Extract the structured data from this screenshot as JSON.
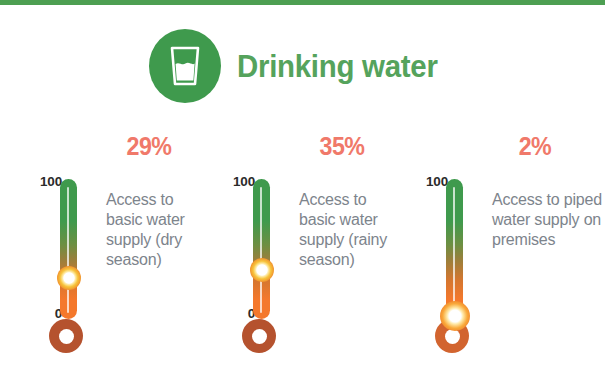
{
  "top_rule": {
    "color": "#4d9f52"
  },
  "header": {
    "icon_name": "drinking-glass-icon",
    "icon_bg_color": "#3f9a4d",
    "title": "Drinking water",
    "title_color": "#55a35c"
  },
  "theme": {
    "percent_color": "#f0796a",
    "caption_color": "#7d848c",
    "scale_label_color": "#2b2b2b",
    "gradient_top_color": "#3f9a4d",
    "gradient_bottom_color": "#f4782c",
    "bulb_color": "#b5522e"
  },
  "chart_data": {
    "type": "bar",
    "title": "Drinking water",
    "xlabel": "",
    "ylabel": "",
    "ylim": [
      0,
      100
    ],
    "axis_tick_labels": [
      "100",
      "0"
    ],
    "categories": [
      "Access to basic water supply (dry season)",
      "Access to basic water supply (rainy season)",
      "Access to piped water supply on premises"
    ],
    "values": [
      29,
      35,
      2
    ],
    "value_labels": [
      "29%",
      "35%",
      "2%"
    ],
    "unit": "%"
  },
  "gauges": [
    {
      "value": 29,
      "percent_label": "29%",
      "scale_max": "100",
      "scale_min": "0",
      "caption": "Access to basic water supply (dry season)",
      "marker_merged": false
    },
    {
      "value": 35,
      "percent_label": "35%",
      "scale_max": "100",
      "scale_min": "0",
      "caption": "Access to basic water supply (rainy season)",
      "marker_merged": false
    },
    {
      "value": 2,
      "percent_label": "2%",
      "scale_max": "100",
      "scale_min": "0",
      "caption": "Access to piped water supply on premises",
      "marker_merged": true
    }
  ]
}
